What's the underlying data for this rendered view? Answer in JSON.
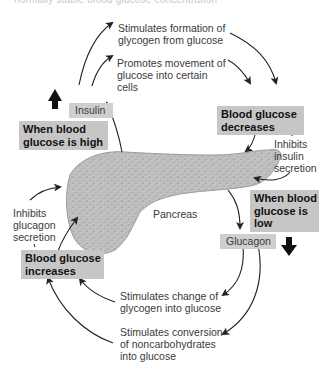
{
  "caption": {
    "partial_text": "normally stable blood glucose concentration"
  },
  "organ": {
    "label": "Pancreas"
  },
  "hormones": {
    "insulin": "Insulin",
    "glucagon": "Glucagon"
  },
  "states": {
    "high": [
      "When blood",
      "glucose is high"
    ],
    "low": [
      "When blood",
      "glucose is",
      "low"
    ],
    "decreases": [
      "Blood glucose",
      "decreases"
    ],
    "increases": [
      "Blood glucose",
      "increases"
    ]
  },
  "effects": {
    "insulin_glycogen": [
      "Stimulates formation of",
      "glycogen from glucose"
    ],
    "insulin_uptake": [
      "Promotes movement of",
      "glucose into certain",
      "cells"
    ],
    "inhibit_insulin": [
      "Inhibits",
      "insulin",
      "secretion"
    ],
    "inhibit_glucagon": [
      "Inhibits",
      "glucagon",
      "secretion"
    ],
    "glucagon_glycogenolysis": [
      "Stimulates change of",
      "glycogen into glucose"
    ],
    "glucagon_gluconeogenesis": [
      "Stimulates conversion",
      "of noncarbohydrates",
      "into glucose"
    ]
  },
  "colors": {
    "state_box": "#c6c6c6",
    "hormone_box": "#cfcfcf",
    "pancreas_fill": "#bdbdbd",
    "arrow": "#222222"
  }
}
